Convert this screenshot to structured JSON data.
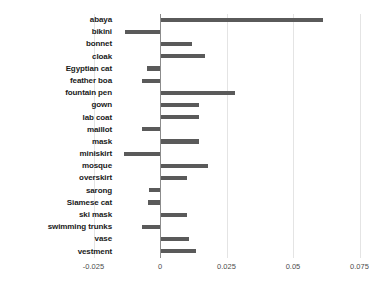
{
  "chart_data": {
    "type": "bar",
    "orientation": "horizontal",
    "title": "",
    "xlabel": "",
    "ylabel": "",
    "xlim": [
      -0.025,
      0.075
    ],
    "xticks": [
      -0.025,
      0,
      0.025,
      0.05,
      0.075
    ],
    "xtick_labels": [
      "-0.025",
      "0",
      "0.025",
      "0.05",
      "0.075"
    ],
    "grid": true,
    "grid_axis": "x",
    "legend": false,
    "bar_color": "#5a5a5a",
    "zero_line_color": "#8c8c8c",
    "gridline_color": "#e4e4e4",
    "categories": [
      "abaya",
      "bikini",
      "bonnet",
      "cloak",
      "Egyptian cat",
      "feather boa",
      "fountain pen",
      "gown",
      "lab coat",
      "maillot",
      "mask",
      "miniskirt",
      "mosque",
      "overskirt",
      "sarong",
      "Siamese cat",
      "ski mask",
      "swimming trunks",
      "vase",
      "vestment"
    ],
    "values": [
      0.0613,
      -0.0132,
      0.012,
      0.017,
      -0.0049,
      -0.0068,
      0.0282,
      0.0145,
      0.0145,
      -0.0068,
      0.0145,
      -0.0136,
      0.018,
      0.01,
      -0.0041,
      -0.0045,
      0.01,
      -0.0068,
      0.011,
      0.0135
    ]
  }
}
